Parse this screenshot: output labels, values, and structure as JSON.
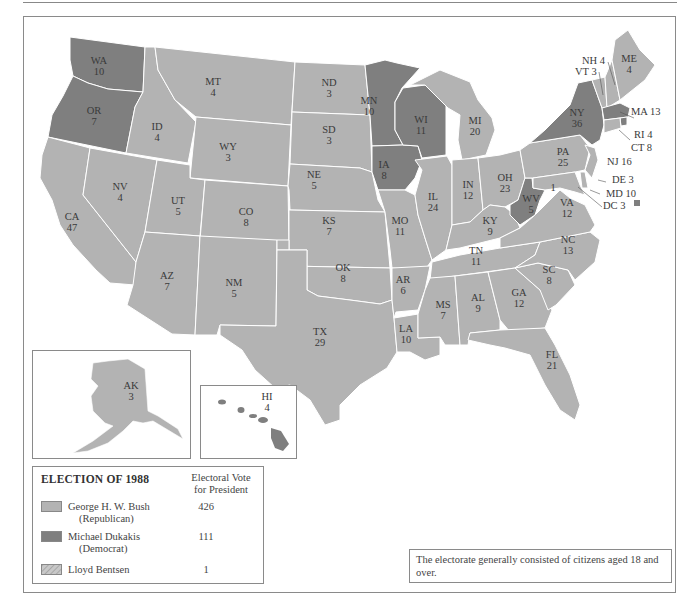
{
  "title": "ELECTION OF 1988",
  "legend": {
    "title": "ELECTION OF 1988",
    "column_header_line1": "Electoral Vote",
    "column_header_line2": "for President",
    "entries": [
      {
        "name": "George H. W. Bush",
        "party": "(Republican)",
        "votes": "426",
        "color": "#b3b3b3",
        "pattern": "solid"
      },
      {
        "name": "Michael Dukakis",
        "party": "(Democrat)",
        "votes": "111",
        "color": "#7f7f7f",
        "pattern": "solid"
      },
      {
        "name": "Lloyd Bentsen",
        "party": "",
        "votes": "1",
        "color": "#c4c4c4",
        "pattern": "hatched"
      }
    ]
  },
  "note": "The electorate generally consisted of citizens aged 18 and over.",
  "colors": {
    "republican": "#b3b3b3",
    "democrat": "#7f7f7f",
    "border": "#ffffff",
    "frame": "#8a8a8a"
  },
  "states": [
    {
      "abbr": "WA",
      "votes": "10",
      "winner": "Dukakis"
    },
    {
      "abbr": "OR",
      "votes": "7",
      "winner": "Dukakis"
    },
    {
      "abbr": "CA",
      "votes": "47",
      "winner": "Bush"
    },
    {
      "abbr": "ID",
      "votes": "4",
      "winner": "Bush"
    },
    {
      "abbr": "NV",
      "votes": "4",
      "winner": "Bush"
    },
    {
      "abbr": "MT",
      "votes": "4",
      "winner": "Bush"
    },
    {
      "abbr": "WY",
      "votes": "3",
      "winner": "Bush"
    },
    {
      "abbr": "UT",
      "votes": "5",
      "winner": "Bush"
    },
    {
      "abbr": "CO",
      "votes": "8",
      "winner": "Bush"
    },
    {
      "abbr": "AZ",
      "votes": "7",
      "winner": "Bush"
    },
    {
      "abbr": "NM",
      "votes": "5",
      "winner": "Bush"
    },
    {
      "abbr": "ND",
      "votes": "3",
      "winner": "Bush"
    },
    {
      "abbr": "SD",
      "votes": "3",
      "winner": "Bush"
    },
    {
      "abbr": "NE",
      "votes": "5",
      "winner": "Bush"
    },
    {
      "abbr": "KS",
      "votes": "7",
      "winner": "Bush"
    },
    {
      "abbr": "OK",
      "votes": "8",
      "winner": "Bush"
    },
    {
      "abbr": "TX",
      "votes": "29",
      "winner": "Bush"
    },
    {
      "abbr": "MN",
      "votes": "10",
      "winner": "Dukakis"
    },
    {
      "abbr": "IA",
      "votes": "8",
      "winner": "Dukakis"
    },
    {
      "abbr": "MO",
      "votes": "11",
      "winner": "Bush"
    },
    {
      "abbr": "AR",
      "votes": "6",
      "winner": "Bush"
    },
    {
      "abbr": "LA",
      "votes": "10",
      "winner": "Bush"
    },
    {
      "abbr": "WI",
      "votes": "11",
      "winner": "Dukakis"
    },
    {
      "abbr": "IL",
      "votes": "24",
      "winner": "Bush"
    },
    {
      "abbr": "MI",
      "votes": "20",
      "winner": "Bush"
    },
    {
      "abbr": "IN",
      "votes": "12",
      "winner": "Bush"
    },
    {
      "abbr": "OH",
      "votes": "23",
      "winner": "Bush"
    },
    {
      "abbr": "KY",
      "votes": "9",
      "winner": "Bush"
    },
    {
      "abbr": "TN",
      "votes": "11",
      "winner": "Bush"
    },
    {
      "abbr": "MS",
      "votes": "7",
      "winner": "Bush"
    },
    {
      "abbr": "AL",
      "votes": "9",
      "winner": "Bush"
    },
    {
      "abbr": "GA",
      "votes": "12",
      "winner": "Bush"
    },
    {
      "abbr": "FL",
      "votes": "21",
      "winner": "Bush"
    },
    {
      "abbr": "SC",
      "votes": "8",
      "winner": "Bush"
    },
    {
      "abbr": "NC",
      "votes": "13",
      "winner": "Bush"
    },
    {
      "abbr": "VA",
      "votes": "12",
      "winner": "Bush"
    },
    {
      "abbr": "WV",
      "votes": "5",
      "winner": "Dukakis",
      "note": "1 (Bentsen)"
    },
    {
      "abbr": "PA",
      "votes": "25",
      "winner": "Bush"
    },
    {
      "abbr": "NY",
      "votes": "36",
      "winner": "Dukakis"
    },
    {
      "abbr": "NJ",
      "votes": "16",
      "winner": "Bush"
    },
    {
      "abbr": "DE",
      "votes": "3",
      "winner": "Bush"
    },
    {
      "abbr": "MD",
      "votes": "10",
      "winner": "Bush"
    },
    {
      "abbr": "DC",
      "votes": "3",
      "winner": "Dukakis"
    },
    {
      "abbr": "VT",
      "votes": "3",
      "winner": "Bush"
    },
    {
      "abbr": "NH",
      "votes": "4",
      "winner": "Bush"
    },
    {
      "abbr": "ME",
      "votes": "4",
      "winner": "Bush"
    },
    {
      "abbr": "MA",
      "votes": "13",
      "winner": "Dukakis"
    },
    {
      "abbr": "RI",
      "votes": "4",
      "winner": "Dukakis"
    },
    {
      "abbr": "CT",
      "votes": "8",
      "winner": "Bush"
    },
    {
      "abbr": "AK",
      "votes": "3",
      "winner": "Bush"
    },
    {
      "abbr": "HI",
      "votes": "4",
      "winner": "Dukakis"
    }
  ],
  "labels": {
    "WA": [
      "WA",
      "10"
    ],
    "OR": [
      "OR",
      "7"
    ],
    "CA": [
      "CA",
      "47"
    ],
    "ID": [
      "ID",
      "4"
    ],
    "NV": [
      "NV",
      "4"
    ],
    "MT": [
      "MT",
      "4"
    ],
    "WY": [
      "WY",
      "3"
    ],
    "UT": [
      "UT",
      "5"
    ],
    "CO": [
      "CO",
      "8"
    ],
    "AZ": [
      "AZ",
      "7"
    ],
    "NM": [
      "NM",
      "5"
    ],
    "ND": [
      "ND",
      "3"
    ],
    "SD": [
      "SD",
      "3"
    ],
    "NE": [
      "NE",
      "5"
    ],
    "KS": [
      "KS",
      "7"
    ],
    "OK": [
      "OK",
      "8"
    ],
    "TX": [
      "TX",
      "29"
    ],
    "MN": [
      "MN",
      "10"
    ],
    "IA": [
      "IA",
      "8"
    ],
    "MO": [
      "MO",
      "11"
    ],
    "AR": [
      "AR",
      "6"
    ],
    "LA": [
      "LA",
      "10"
    ],
    "WI": [
      "WI",
      "11"
    ],
    "IL": [
      "IL",
      "24"
    ],
    "MI": [
      "MI",
      "20"
    ],
    "IN": [
      "IN",
      "12"
    ],
    "OH": [
      "OH",
      "23"
    ],
    "KY": [
      "KY",
      "9"
    ],
    "TN": [
      "TN",
      "11"
    ],
    "MS": [
      "MS",
      "7"
    ],
    "AL": [
      "AL",
      "9"
    ],
    "GA": [
      "GA",
      "12"
    ],
    "FL": [
      "FL",
      "21"
    ],
    "SC": [
      "SC",
      "8"
    ],
    "NC": [
      "NC",
      "13"
    ],
    "VA": [
      "VA",
      "12"
    ],
    "WV": [
      "WV",
      "5"
    ],
    "WV_bentsen": "1",
    "PA": [
      "PA",
      "25"
    ],
    "NY": [
      "NY",
      "36"
    ],
    "ME": [
      "ME",
      "4"
    ],
    "AK": [
      "AK",
      "3"
    ],
    "HI": [
      "HI",
      "4"
    ],
    "NH": "NH 4",
    "VT": "VT 3",
    "MA": "MA 13",
    "RI": "RI 4",
    "CT": "CT 8",
    "NJ": "NJ 16",
    "DE": "DE 3",
    "MD": "MD 10",
    "DC": "DC 3"
  }
}
